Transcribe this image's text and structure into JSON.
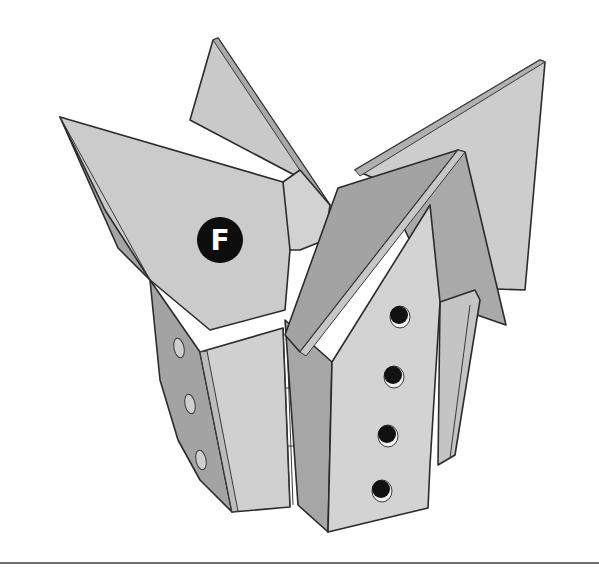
{
  "figure": {
    "callout": {
      "label": "F",
      "cx": 220,
      "cy": 240,
      "r": 23
    },
    "entrance_holes_front": 4,
    "entrance_holes_side": 3
  },
  "colors": {
    "background": "#ffffff",
    "light_panel": "#cfcfcf",
    "mid_panel": "#bdbdbd",
    "dark_panel": "#9a9a9a",
    "edge": "#2b2b2b",
    "hole": "#111111",
    "callout_fill": "#0d0d0d",
    "callout_text": "#ffffff",
    "rule": "#6e6e6e"
  }
}
